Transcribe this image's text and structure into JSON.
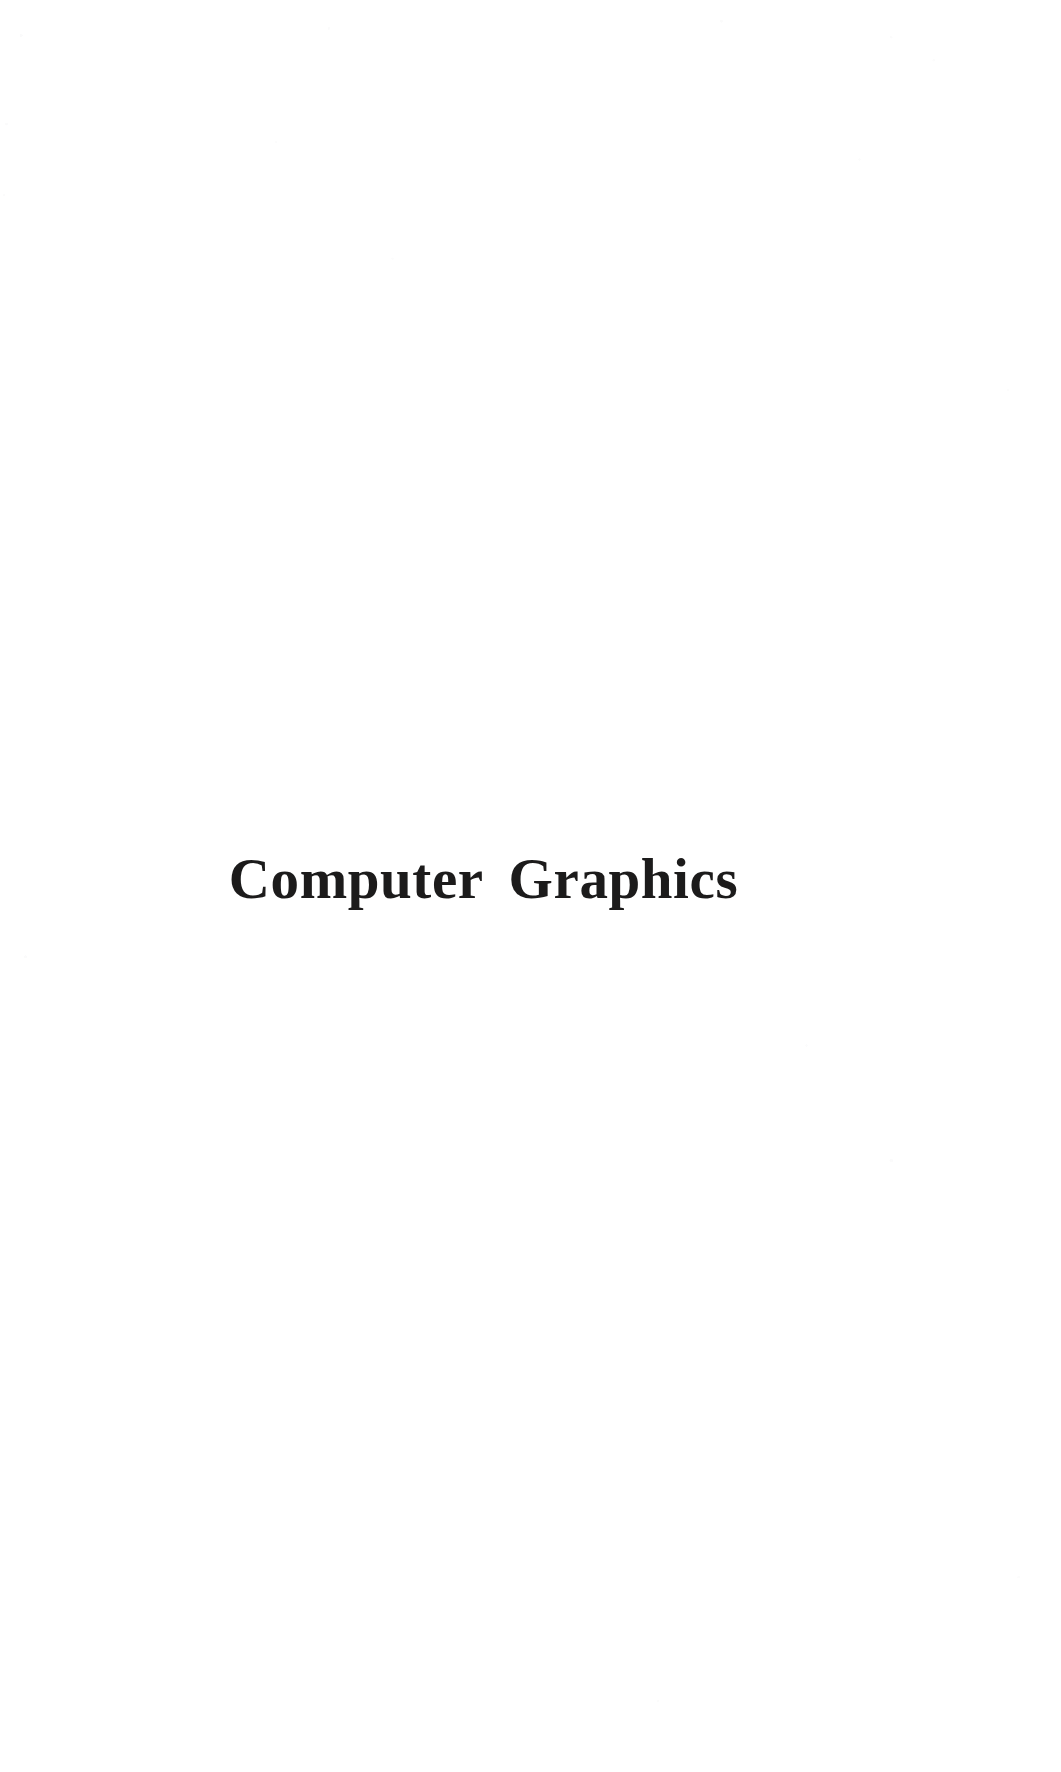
{
  "document": {
    "kind": "book-section-divider-page",
    "page_background_color": "#ffffff",
    "title": "Computer Graphics",
    "title_color": "#1c1b1b",
    "title_alignment": "center",
    "body_text": "",
    "page_number": "",
    "header": "",
    "footer": ""
  }
}
